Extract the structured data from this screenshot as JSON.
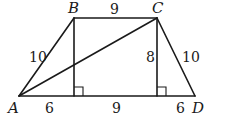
{
  "figure": {
    "type": "isosceles-trapezoid"
  },
  "vertices": {
    "A": {
      "label": "A"
    },
    "B": {
      "label": "B"
    },
    "C": {
      "label": "C"
    },
    "D": {
      "label": "D"
    }
  },
  "segments": [
    {
      "id": "AB",
      "from": "A",
      "to": "B",
      "length_label": "10"
    },
    {
      "id": "BC",
      "from": "B",
      "to": "C",
      "length_label": "9"
    },
    {
      "id": "CD",
      "from": "C",
      "to": "D",
      "length_label": "10"
    },
    {
      "id": "AD",
      "from": "A",
      "to": "D",
      "length_label": ""
    },
    {
      "id": "AC",
      "from": "A",
      "to": "C",
      "length_label": ""
    },
    {
      "id": "BH1",
      "from": "B",
      "to": "H1",
      "length_label": ""
    },
    {
      "id": "CH2",
      "from": "C",
      "to": "H2",
      "length_label": "8"
    }
  ],
  "base_parts": [
    {
      "id": "AH1",
      "length_label": "6"
    },
    {
      "id": "H1H2",
      "length_label": "9"
    },
    {
      "id": "H2D",
      "length_label": "6"
    }
  ],
  "labels": {
    "A": "A",
    "B": "B",
    "C": "C",
    "D": "D",
    "AB": "10",
    "BC": "9",
    "CD": "10",
    "altitude_C": "8",
    "base_left": "6",
    "base_middle": "9",
    "base_right": "6"
  },
  "right_angles": [
    "H1",
    "H2"
  ]
}
